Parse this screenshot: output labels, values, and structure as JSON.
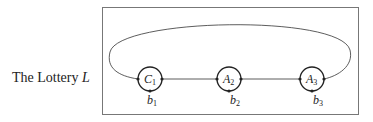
{
  "title": {
    "text": "The Lottery ",
    "var": "L"
  },
  "nodes": [
    {
      "id": "C1",
      "letter": "C",
      "sub": "1",
      "bottom_letter": "b",
      "bottom_sub": "1"
    },
    {
      "id": "A2",
      "letter": "A",
      "sub": "2",
      "bottom_letter": "b",
      "bottom_sub": "2"
    },
    {
      "id": "A3",
      "letter": "A",
      "sub": "3",
      "bottom_letter": "b",
      "bottom_sub": "3"
    }
  ],
  "colors": {
    "stroke": "#333333",
    "box": "#777777"
  }
}
